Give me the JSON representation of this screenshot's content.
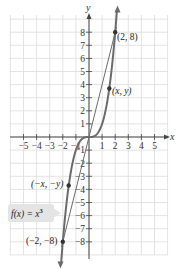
{
  "chart_data": {
    "type": "line",
    "title": "",
    "xlabel": "x",
    "ylabel": "y",
    "xlim": [
      -6,
      6
    ],
    "ylim": [
      -9,
      9
    ],
    "grid": true,
    "x_ticks": [
      -5,
      -4,
      -3,
      -2,
      -1,
      1,
      2,
      3,
      4,
      5
    ],
    "x_tick_labels": [
      "−5",
      "−4",
      "−3",
      "−2",
      "−1",
      "1",
      "2",
      "3",
      "4",
      "5"
    ],
    "y_ticks": [
      8,
      7,
      6,
      5,
      4,
      3,
      2,
      1,
      -1,
      -2,
      -3,
      -4,
      -5,
      -6,
      -7,
      -8
    ],
    "y_tick_labels": [
      "8",
      "7",
      "6",
      "5",
      "4",
      "3",
      "2",
      "1",
      "−1",
      "−2",
      "−3",
      "−4",
      "−5",
      "−6",
      "−7",
      "−8"
    ],
    "series": [
      {
        "name": "f(x) = x^3",
        "function": "x^3",
        "x": [
          -2,
          -1.5,
          -1,
          -0.5,
          0,
          0.5,
          1,
          1.5,
          2
        ],
        "values": [
          -8,
          -3.375,
          -1,
          -0.125,
          0,
          0.125,
          1,
          3.375,
          8
        ],
        "color": "#6b6b6b"
      },
      {
        "name": "secant line through origin",
        "x": [
          -2.1,
          2.1
        ],
        "values": [
          -8.4,
          8.4
        ],
        "color": "#6b6b6b"
      }
    ],
    "points": [
      {
        "label": "(2, 8)",
        "x": 2,
        "y": 8
      },
      {
        "label": "(x, y)",
        "x": 1.55,
        "y": 3.7
      },
      {
        "label": "(−x, −y)",
        "x": -1.55,
        "y": -3.7
      },
      {
        "label": "(−2, −8)",
        "x": -2,
        "y": -8
      }
    ],
    "annotations": [
      {
        "text": "f(x) = x³",
        "position": "left-middle-lower",
        "style": "gray callout box"
      }
    ]
  },
  "labels": {
    "x_axis": "x",
    "y_axis": "y",
    "function_label_prefix": "f(x) = x",
    "function_label_exp": "3",
    "pt_2_8": "(2, 8)",
    "pt_xy": "(x, y)",
    "pt_neg_xy": "(−x, −y)",
    "pt_neg2_neg8": "(−2, −8)"
  },
  "colors": {
    "grid": "#dcdcdc",
    "axis": "#444444",
    "curve": "#707070",
    "callout_bg": "#e6e6e6"
  }
}
